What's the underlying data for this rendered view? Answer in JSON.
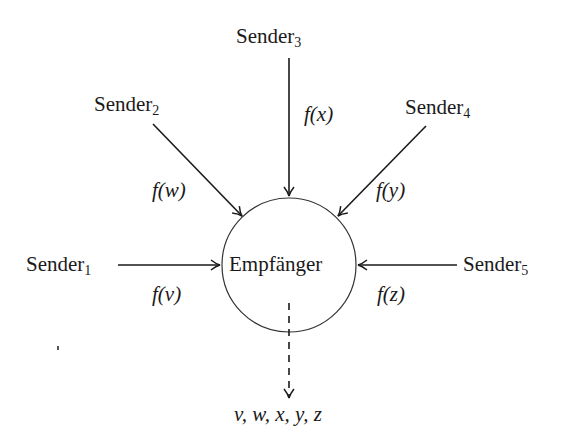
{
  "receiver": {
    "label": "Empfänger"
  },
  "senders": [
    {
      "name": "Sender",
      "index": "1",
      "function": "f(v)"
    },
    {
      "name": "Sender",
      "index": "2",
      "function": "f(w)"
    },
    {
      "name": "Sender",
      "index": "3",
      "function": "f(x)"
    },
    {
      "name": "Sender",
      "index": "4",
      "function": "f(y)"
    },
    {
      "name": "Sender",
      "index": "5",
      "function": "f(z)"
    }
  ],
  "output": {
    "label": "v, w, x, y, z"
  },
  "colors": {
    "line": "#1a1a1a",
    "background": "#ffffff"
  }
}
